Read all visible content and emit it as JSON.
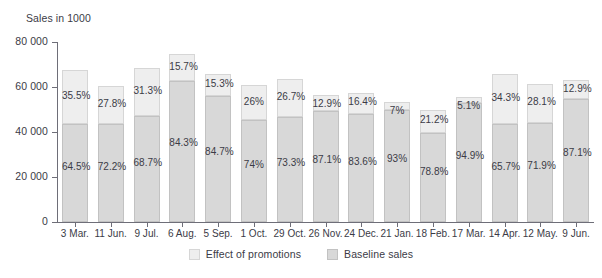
{
  "chart_data": {
    "type": "bar",
    "subtype": "stacked-bar",
    "title": "",
    "ylabel": "Sales in 1000",
    "xlabel": "",
    "ylim": [
      0,
      80000
    ],
    "yticks": [
      0,
      20000,
      40000,
      60000,
      80000
    ],
    "ytick_labels": [
      "0",
      "20 000",
      "40 000",
      "60 000",
      "80 000"
    ],
    "grid": false,
    "legend_position": "bottom-center",
    "legend": [
      "Effect of promotions",
      "Baseline sales"
    ],
    "categories": [
      "3 Mar.",
      "11 Jun.",
      "9 Jul.",
      "6 Aug.",
      "5 Sep.",
      "1 Oct.",
      "29 Oct.",
      "26 Nov.",
      "24 Dec.",
      "21 Jan.",
      "18 Feb.",
      "17 Mar.",
      "14 Apr.",
      "12 May.",
      "9 Jun."
    ],
    "totals": [
      67500,
      60500,
      68500,
      74500,
      66000,
      61000,
      63500,
      56500,
      57500,
      53500,
      50000,
      55500,
      66000,
      61500,
      63000
    ],
    "series": [
      {
        "name": "Baseline sales",
        "color": "#d8d8d8",
        "percent_labels": [
          "64.5%",
          "72.2%",
          "68.7%",
          "84.3%",
          "84.7%",
          "74%",
          "73.3%",
          "87.1%",
          "83.6%",
          "93%",
          "78.8%",
          "94.9%",
          "65.7%",
          "71.9%",
          "87.1%"
        ],
        "percent_values": [
          64.5,
          72.2,
          68.7,
          84.3,
          84.7,
          74,
          73.3,
          87.1,
          83.6,
          93,
          78.8,
          94.9,
          65.7,
          71.9,
          87.1
        ]
      },
      {
        "name": "Effect of promotions",
        "color": "#eeeeee",
        "percent_labels": [
          "35.5%",
          "27.8%",
          "31.3%",
          "15.7%",
          "15.3%",
          "26%",
          "26.7%",
          "12.9%",
          "16.4%",
          "7%",
          "21.2%",
          "5.1%",
          "34.3%",
          "28.1%",
          "12.9%"
        ],
        "percent_values": [
          35.5,
          27.8,
          31.3,
          15.7,
          15.3,
          26,
          26.7,
          12.9,
          16.4,
          7,
          21.2,
          5.1,
          34.3,
          28.1,
          12.9
        ]
      }
    ]
  },
  "colors": {
    "promotions": "#eeeeee",
    "promotions_border": "#d6d6d6",
    "baseline": "#d8d8d8",
    "baseline_border": "#c2c2c2",
    "axis": "#6e6e78",
    "text": "#3b3b46",
    "background": "#ffffff"
  }
}
